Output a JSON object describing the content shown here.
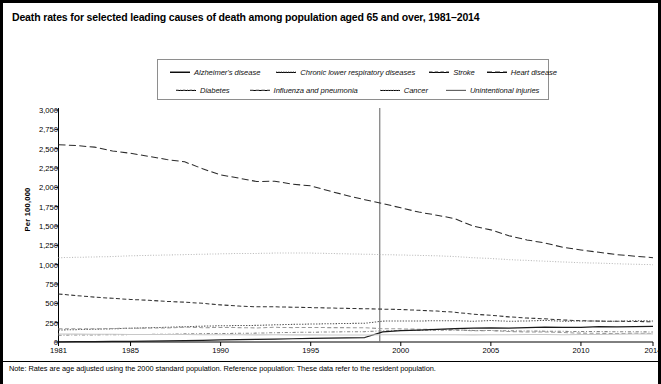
{
  "title": "Death rates for selected leading causes of death among population aged 65 and over, 1981–2014",
  "note": "Note: Rates are age adjusted using the 2000 standard population. Reference population: These data refer to the resident population.",
  "axis": {
    "ylabel": "Per 100,000",
    "yticks": [
      "3,000",
      "2,750",
      "2,500",
      "2,250",
      "2,000",
      "1,750",
      "1,500",
      "1,250",
      "1,000",
      "750",
      "500",
      "250",
      "0"
    ],
    "xticks": [
      "1981",
      "1985",
      "1990",
      "1995",
      "2000",
      "2005",
      "2010",
      "2014"
    ]
  },
  "legend": {
    "row1": [
      {
        "label": "Alzheimer's disease",
        "style": "solid",
        "color": "#1a1a1a"
      },
      {
        "label": "Chronic lower respiratory diseases",
        "style": "dotted",
        "color": "#555555"
      },
      {
        "label": "Stroke",
        "style": "dashed",
        "color": "#333333"
      },
      {
        "label": "Heart disease",
        "style": "longdash",
        "color": "#2b2b2b"
      }
    ],
    "row2": [
      {
        "label": "Diabetes",
        "style": "dashdot",
        "color": "#8a8a8a"
      },
      {
        "label": "Influenza and pneumonia",
        "style": "dashed",
        "color": "#9a9a9a"
      },
      {
        "label": "Cancer",
        "style": "finedot",
        "color": "#bdbdbd"
      },
      {
        "label": "Unintentional injuries",
        "style": "solidlight",
        "color": "#c8c8c8"
      }
    ]
  },
  "annotation": {
    "comparability_line_year": 1999,
    "comparability_line_label": ""
  },
  "chart_data": {
    "type": "line",
    "title": "Death rates for selected leading causes of death among population aged 65 and over, 1981–2014",
    "xlabel": "",
    "ylabel": "Per 100,000",
    "xlim": [
      1981,
      2014
    ],
    "ylim": [
      0,
      3000
    ],
    "grid": false,
    "legend_position": "top-center",
    "x": [
      1981,
      1982,
      1983,
      1984,
      1985,
      1986,
      1987,
      1988,
      1989,
      1990,
      1991,
      1992,
      1993,
      1994,
      1995,
      1996,
      1997,
      1998,
      1999,
      2000,
      2001,
      2002,
      2003,
      2004,
      2005,
      2006,
      2007,
      2008,
      2009,
      2010,
      2011,
      2012,
      2013,
      2014
    ],
    "series": [
      {
        "name": "Heart disease",
        "style": "longdash",
        "color": "#2b2b2b",
        "values": [
          2550,
          2540,
          2520,
          2470,
          2440,
          2400,
          2360,
          2330,
          2240,
          2160,
          2120,
          2075,
          2080,
          2040,
          2020,
          1955,
          1895,
          1840,
          1790,
          1735,
          1680,
          1640,
          1595,
          1500,
          1450,
          1375,
          1320,
          1280,
          1225,
          1190,
          1160,
          1130,
          1110,
          1090
        ]
      },
      {
        "name": "Cancer",
        "style": "finedot",
        "color": "#bdbdbd",
        "values": [
          1090,
          1095,
          1100,
          1105,
          1115,
          1120,
          1125,
          1130,
          1135,
          1140,
          1145,
          1145,
          1150,
          1150,
          1150,
          1145,
          1140,
          1135,
          1130,
          1125,
          1120,
          1115,
          1105,
          1090,
          1080,
          1065,
          1055,
          1045,
          1035,
          1025,
          1020,
          1012,
          1005,
          1000
        ]
      },
      {
        "name": "Stroke",
        "style": "dashed",
        "color": "#333333",
        "values": [
          620,
          600,
          580,
          565,
          550,
          540,
          525,
          515,
          500,
          480,
          465,
          455,
          455,
          450,
          445,
          440,
          435,
          430,
          425,
          420,
          410,
          400,
          385,
          360,
          345,
          325,
          310,
          300,
          285,
          275,
          270,
          268,
          265,
          262
        ]
      },
      {
        "name": "Chronic lower respiratory diseases",
        "style": "dotted",
        "color": "#555555",
        "values": [
          155,
          160,
          165,
          170,
          178,
          185,
          190,
          198,
          205,
          210,
          213,
          215,
          222,
          228,
          232,
          236,
          240,
          242,
          270,
          272,
          272,
          275,
          276,
          268,
          278,
          268,
          272,
          280,
          268,
          272,
          270,
          268,
          275,
          272
        ]
      },
      {
        "name": "Influenza and pneumonia",
        "style": "dashed",
        "color": "#9a9a9a",
        "values": [
          170,
          172,
          170,
          175,
          178,
          180,
          180,
          192,
          185,
          188,
          186,
          182,
          190,
          186,
          188,
          186,
          186,
          184,
          172,
          170,
          165,
          162,
          160,
          145,
          148,
          135,
          130,
          130,
          122,
          115,
          112,
          110,
          112,
          110
        ]
      },
      {
        "name": "Diabetes",
        "style": "dashdot",
        "color": "#8a8a8a",
        "values": [
          88,
          90,
          92,
          94,
          96,
          98,
          100,
          105,
          108,
          110,
          112,
          115,
          120,
          124,
          126,
          130,
          132,
          134,
          145,
          148,
          150,
          152,
          152,
          150,
          148,
          145,
          142,
          140,
          138,
          135,
          135,
          133,
          132,
          130
        ]
      },
      {
        "name": "Alzheimer's disease",
        "style": "solid",
        "color": "#1a1a1a",
        "values": [
          3,
          4,
          5,
          7,
          9,
          12,
          15,
          18,
          22,
          26,
          30,
          34,
          38,
          42,
          46,
          50,
          54,
          58,
          130,
          148,
          155,
          162,
          172,
          178,
          182,
          180,
          185,
          192,
          188,
          190,
          198,
          196,
          200,
          202
        ]
      },
      {
        "name": "Unintentional injuries",
        "style": "solidlight",
        "color": "#c8c8c8",
        "values": [
          104,
          102,
          100,
          99,
          98,
          97,
          96,
          96,
          95,
          94,
          93,
          92,
          93,
          92,
          92,
          91,
          90,
          90,
          93,
          93,
          93,
          94,
          95,
          92,
          94,
          94,
          96,
          97,
          95,
          96,
          98,
          100,
          103,
          105
        ]
      }
    ]
  }
}
